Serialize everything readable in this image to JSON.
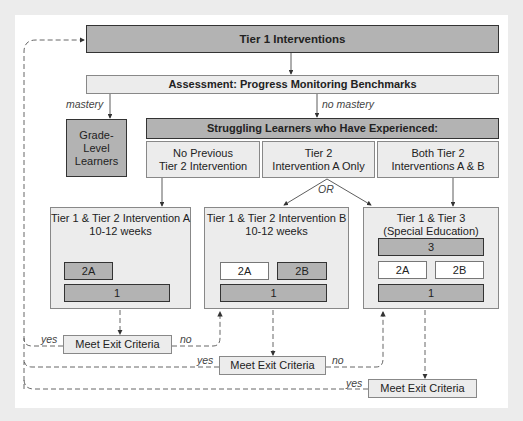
{
  "diagram": {
    "tier1": "Tier 1 Interventions",
    "assessment": "Assessment: Progress Monitoring Benchmarks",
    "mastery_label": "mastery",
    "no_mastery_label": "no mastery",
    "grade_level": "Grade-\nLevel\nLearners",
    "struggling": "Struggling Learners who Have Experienced:",
    "categories": [
      "No Previous\nTier 2 Intervention",
      "Tier 2\nIntervention A Only",
      "Both Tier 2\nInterventions A & B"
    ],
    "or_label": "OR",
    "interventions": [
      {
        "title": "Tier 1 & Tier 2 Intervention A\n10-12 weeks",
        "blocks": [
          "2A",
          "1"
        ]
      },
      {
        "title": "Tier 1 & Tier 2 Intervention B\n10-12 weeks",
        "blocks": [
          "2A",
          "2B",
          "1"
        ]
      },
      {
        "title": "Tier 1 & Tier 3\n(Special Education)",
        "blocks": [
          "3",
          "2A",
          "2B",
          "1"
        ]
      }
    ],
    "exit_label": "Meet Exit Criteria",
    "yes_label": "yes",
    "no_label": "no"
  }
}
